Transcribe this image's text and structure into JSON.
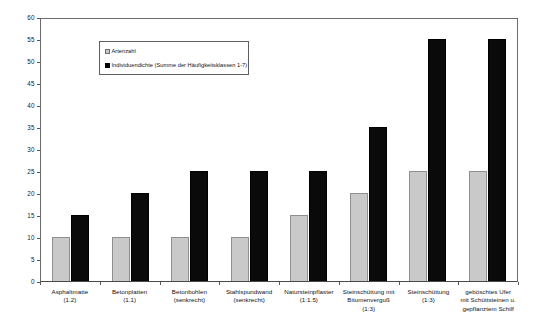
{
  "chart_data": {
    "type": "bar",
    "title": "",
    "subtitle": "",
    "xlabel": "",
    "ylabel": "",
    "ylim": [
      0,
      60
    ],
    "ytick_step": 5,
    "yticks": [
      60,
      55,
      50,
      45,
      40,
      35,
      30,
      25,
      20,
      15,
      10,
      5,
      0
    ],
    "grid": false,
    "legend_position": "upper-left-inside",
    "categories": [
      "Asphaltmatte (1.2)",
      "Betonplatten (1.1)",
      "Betonbohlen (senkrecht)",
      "Stahlspundwand (senkrecht)",
      "Natursteinpflaster (1:1.5)",
      "Steinschüttung mit Bitumenverguß (1:3)",
      "Steinschüttung (1:3)",
      "geböschtes Ufer mit Schüttsteinen u. gepflanztem Schilf"
    ],
    "category_lines": [
      [
        "Asphaltmatte",
        "(1.2)"
      ],
      [
        "Betonplatten",
        "(1.1)"
      ],
      [
        "Betonbohlen",
        "(senkrecht)"
      ],
      [
        "Stahlspundwand",
        "(senkrecht)"
      ],
      [
        "Natursteinpflaster",
        "(1:1.5)"
      ],
      [
        "Steinschüttung mit",
        "Bitumenverguß",
        "(1:3)"
      ],
      [
        "Steinschüttung",
        "(1:3)"
      ],
      [
        "geböschtes Ufer",
        "mit Schüttsteinen u.",
        "gepflanztem Schilf"
      ]
    ],
    "series": [
      {
        "name": "Artenzahl",
        "color": "#c9c9c9",
        "values": [
          10,
          10,
          10,
          10,
          15,
          20,
          25,
          25
        ]
      },
      {
        "name": "Individuendichte (Summe der Häufigkeitsklassen 1-7)",
        "color": "#000000",
        "values": [
          15,
          20,
          25,
          25,
          25,
          35,
          55,
          55
        ]
      }
    ]
  },
  "legend": {
    "items": [
      {
        "label": "Artenzahl"
      },
      {
        "label": "Individuendichte (Summe der Häufigkeitsklassen 1-7)"
      }
    ]
  }
}
